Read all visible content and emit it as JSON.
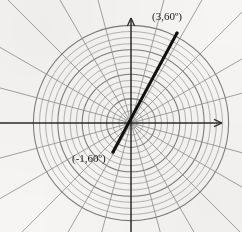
{
  "figure": {
    "kind": "polar-grid-plot",
    "background_color": "#f6f5f3",
    "width": 242,
    "height": 232
  },
  "chart_data": {
    "type": "scatter",
    "coordinate_system": "polar",
    "title": "",
    "xlabel": "",
    "ylabel": "",
    "grid": true,
    "legend_position": "none",
    "center_px": [
      131,
      123
    ],
    "axes": {
      "horizontal_axis": {
        "label": "",
        "arrow": "right",
        "y_px": 123
      },
      "vertical_axis": {
        "label": "",
        "arrow": "up",
        "x_px": 131
      }
    },
    "polar_grid": {
      "radial_spokes": 24,
      "spoke_angle_step_deg": 15,
      "circle_count": 16,
      "circle_spacing_px": 6.1,
      "max_radius_px": 98,
      "grid_color": "#8d8d8d",
      "axis_color": "#2a2a2a"
    },
    "ray": {
      "description": "thick line through the pole at 60 degrees",
      "angle_deg": 60,
      "color": "#111111",
      "width_px": 3,
      "from_r": -1,
      "to_r": 3,
      "start_px": [
        113,
        152
      ],
      "end_px": [
        177,
        33
      ]
    },
    "points": [
      {
        "label": "(3,60º)",
        "r": 3,
        "theta_deg": 60,
        "px": [
          177,
          33
        ]
      },
      {
        "label": "(-1,60º)",
        "r": -1,
        "theta_deg": 60,
        "px": [
          113,
          152
        ]
      }
    ],
    "annotations": [
      {
        "name": "point-label-positive",
        "text": "(3,60º)"
      },
      {
        "name": "point-label-negative",
        "text": "(-1,60º)"
      }
    ]
  },
  "labels": {
    "point_positive": "(3,60º)",
    "point_negative": "(-1,60º)"
  }
}
